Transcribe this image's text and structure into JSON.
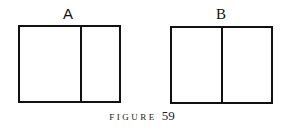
{
  "figure": {
    "caption_word": "FIGURE",
    "caption_number": "59",
    "panels": [
      {
        "label": "A",
        "divider_position": "off-center (~60% from left)"
      },
      {
        "label": "B",
        "divider_position": "center (50%)"
      }
    ]
  }
}
